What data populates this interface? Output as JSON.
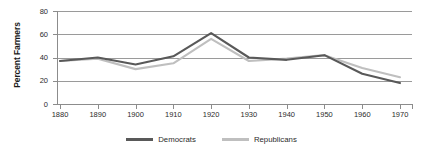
{
  "chart_data": {
    "type": "line",
    "title": "",
    "xlabel": "",
    "ylabel": "Percent Farmers",
    "x": [
      1880,
      1890,
      1900,
      1910,
      1920,
      1930,
      1940,
      1950,
      1960,
      1970
    ],
    "xtick_labels": [
      "1880",
      "1890",
      "1900",
      "1910",
      "1920",
      "1930",
      "1940",
      "1950",
      "1960",
      "1970"
    ],
    "ytick_labels": [
      "0",
      "20",
      "40",
      "60",
      "80"
    ],
    "yticks": [
      0,
      20,
      40,
      60,
      80
    ],
    "ylim": [
      0,
      80
    ],
    "xlim": [
      1875,
      1975
    ],
    "grid": "horizontal",
    "legend_position": "bottom-center",
    "series": [
      {
        "name": "Democrats",
        "color": "#595959",
        "values": [
          37,
          40,
          34,
          41,
          61,
          40,
          38,
          42,
          26,
          18
        ]
      },
      {
        "name": "Republicans",
        "color": "#bfbfbf",
        "values": [
          37,
          39,
          30,
          35,
          56,
          37,
          39,
          42,
          31,
          23
        ]
      }
    ]
  },
  "legend": {
    "items": [
      {
        "label": "Democrats",
        "color": "#595959"
      },
      {
        "label": "Republicans",
        "color": "#bfbfbf"
      }
    ]
  },
  "axes": {
    "y_title": "Percent Farmers"
  }
}
